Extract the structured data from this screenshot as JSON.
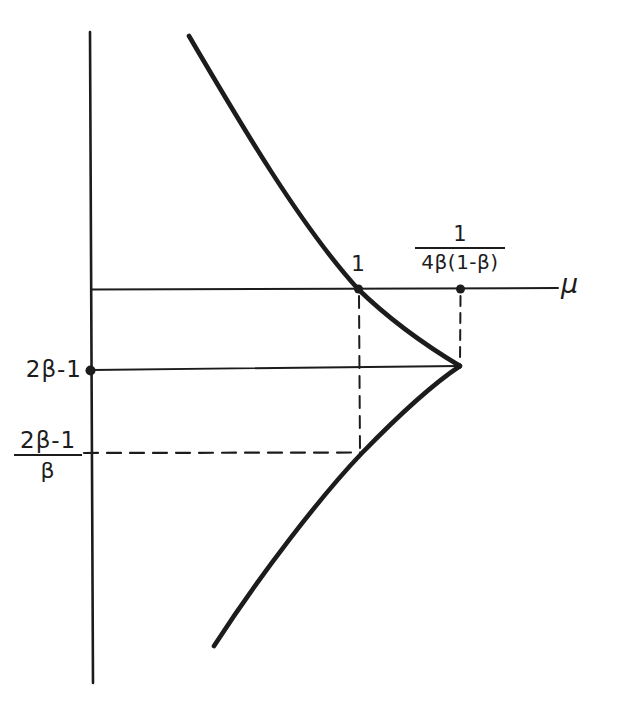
{
  "canvas": {
    "width": 618,
    "height": 707,
    "background": "#ffffff",
    "ink": "#1c1c1c"
  },
  "labels": {
    "mu_axis": "μ",
    "one": "1",
    "vertex_level": "2β-1",
    "ratio_fraction": {
      "numerator": "2β-1",
      "denominator": "β"
    },
    "max_fraction": {
      "numerator": "1",
      "denominator": "4β(1-β)"
    }
  },
  "figure": {
    "type": "qualitative-curve-diagram",
    "key_points": [
      {
        "label": "1",
        "on": "mu-axis",
        "marks": "curve crossing of the mu-axis"
      },
      {
        "label": "1/(4β(1-β))",
        "on": "mu-axis",
        "marks": "mu value at the curve vertex (dashed drop line)"
      },
      {
        "label": "2β-1",
        "on": "vertical-axis",
        "marks": "level of the vertex (solid line, dot on axis)"
      },
      {
        "label": "(2β-1)/β",
        "on": "vertical-axis",
        "marks": "level where dashed horizontal meets curve below axis"
      }
    ]
  },
  "geometry": {
    "lines": [
      {
        "name": "y-axis",
        "x1": 90,
        "y1": 32,
        "x2": 93,
        "y2": 683,
        "w": 2.6
      },
      {
        "name": "mu-axis",
        "x1": 91,
        "y1": 289.5,
        "x2": 558,
        "y2": 288,
        "w": 2
      },
      {
        "name": "vertex-level-line",
        "x1": 92,
        "y1": 370,
        "x2": 459,
        "y2": 366,
        "w": 1.8
      },
      {
        "name": "dashed-drop-at-crossing",
        "x1": 359,
        "y1": 296,
        "x2": 360,
        "y2": 452,
        "w": 2,
        "dash": "12 8"
      },
      {
        "name": "dashed-drop-at-vertex",
        "x1": 460.5,
        "y1": 296,
        "x2": 460,
        "y2": 362,
        "w": 2,
        "dash": "10 7"
      },
      {
        "name": "dashed-level-ratio",
        "x1": 84,
        "y1": 453,
        "x2": 360,
        "y2": 452.5,
        "w": 2.2,
        "dash": "14 9"
      }
    ],
    "curve": {
      "name": "curve",
      "w": 4.6,
      "d": "M 189 36 C 240 123, 300 225, 358 289 C 395 325, 430 348, 460 366 C 433 384, 396 418, 362 453 C 320 497, 260 575, 214 646"
    },
    "dots": [
      {
        "name": "dot-curve-axis-crossing",
        "cx": 358.5,
        "cy": 289,
        "r": 4.5
      },
      {
        "name": "dot-max-on-axis",
        "cx": 460.5,
        "cy": 289,
        "r": 4.5
      },
      {
        "name": "dot-vertex-level-on-y-axis",
        "cx": 90.5,
        "cy": 370.5,
        "r": 5
      },
      {
        "name": "dot-vertex",
        "cx": 458.5,
        "cy": 366,
        "r": 3.2
      }
    ]
  }
}
